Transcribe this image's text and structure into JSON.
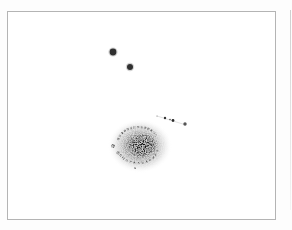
{
  "image": {
    "description": "Negative astronomical photograph of a spiral galaxy with nearby foreground stars, printed inside a thin rectangular frame",
    "frame_color": "#b4b4b4",
    "background_color": "#ffffff",
    "ink_color": "#1e1e1e"
  },
  "objects": {
    "galaxy": {
      "cx": 142,
      "cy": 145,
      "rx": 30,
      "ry": 25,
      "label": "spiral-galaxy"
    },
    "stars": [
      {
        "x": 113,
        "y": 52,
        "r": 3.2,
        "label": "bright-star-1"
      },
      {
        "x": 130,
        "y": 67,
        "r": 2.8,
        "label": "bright-star-2"
      }
    ],
    "star_chain": [
      {
        "x": 157,
        "y": 116,
        "r": 0.6
      },
      {
        "x": 165,
        "y": 118,
        "r": 1.2
      },
      {
        "x": 170,
        "y": 119,
        "r": 0.8
      },
      {
        "x": 173,
        "y": 120,
        "r": 1.3
      },
      {
        "x": 185,
        "y": 124,
        "r": 1.6
      }
    ]
  }
}
